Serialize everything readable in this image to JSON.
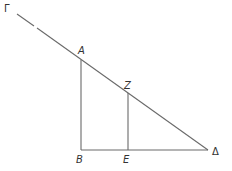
{
  "diagram": {
    "type": "geometry-figure",
    "points": {
      "Gamma": {
        "label": "Γ",
        "x": 17,
        "y": 14
      },
      "A": {
        "label": "A",
        "x": 81,
        "y": 60
      },
      "Z": {
        "label": "Z",
        "x": 128,
        "y": 93
      },
      "B": {
        "label": "B",
        "x": 81,
        "y": 150
      },
      "E": {
        "label": "E",
        "x": 128,
        "y": 150
      },
      "Delta": {
        "label": "Δ",
        "x": 208,
        "y": 150
      }
    },
    "segments": [
      {
        "from": "Gamma",
        "to": "Delta"
      },
      {
        "from": "A",
        "to": "B"
      },
      {
        "from": "Z",
        "to": "E"
      },
      {
        "from": "B",
        "to": "Delta"
      }
    ],
    "colors": {
      "stroke": "#6a6a6a",
      "text": "#333333",
      "background": "#ffffff"
    }
  },
  "labels": {
    "gamma": "Γ",
    "a": "A",
    "z": "Z",
    "b": "B",
    "e": "E",
    "delta": "Δ"
  }
}
